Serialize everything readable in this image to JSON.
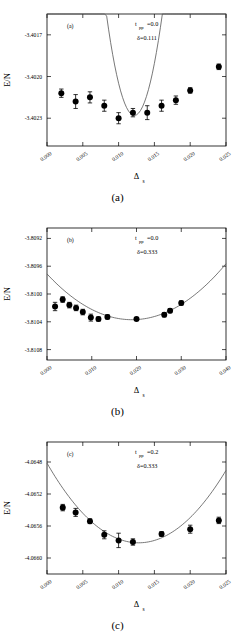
{
  "figure": {
    "panel_captions": [
      "(a)",
      "(b)",
      "(c)"
    ]
  },
  "chart_data": [
    {
      "type": "scatter",
      "panel": "a",
      "panel_tag": "(a)",
      "caption": "(a)",
      "title": "",
      "xlabel": "Δ",
      "xlabel_sub": "s",
      "ylabel": "E/N",
      "xlim": [
        0.0,
        0.025
      ],
      "ylim": [
        -3.4025,
        -3.40155
      ],
      "xticks": [
        0.0,
        0.005,
        0.01,
        0.015,
        0.02,
        0.025
      ],
      "xtick_labels": [
        "0.000",
        "0.005",
        "0.010",
        "0.015",
        "0.020",
        "0.025"
      ],
      "yticks": [
        -3.4017,
        -3.402,
        -3.4023
      ],
      "ytick_labels": [
        "-3.4017",
        "-3.4020",
        "-3.4023"
      ],
      "grid": false,
      "legend": "none",
      "annotations": [
        {
          "text": "t",
          "sub": "pp",
          "tail": "=0.0"
        },
        {
          "text": "δ=0.111",
          "sub": "",
          "tail": ""
        }
      ],
      "annotation_text": [
        "t_pp=0.0",
        "δ=0.111"
      ],
      "x": [
        0.002,
        0.004,
        0.006,
        0.008,
        0.01,
        0.012,
        0.014,
        0.016,
        0.018,
        0.02,
        0.024
      ],
      "y": [
        -3.40212,
        -3.40218,
        -3.40215,
        -3.40221,
        -3.4023,
        -3.40226,
        -3.40226,
        -3.40221,
        -3.40217,
        -3.4021,
        -3.40193
      ],
      "yerr": [
        3e-05,
        5e-05,
        4e-05,
        4e-05,
        4e-05,
        3e-05,
        5e-05,
        4e-05,
        3e-05,
        2e-05,
        2e-05
      ],
      "fit": {
        "type": "parabola",
        "vertex_x": 0.0122,
        "vertex_y": -3.40228,
        "curvature": 1.05
      }
    },
    {
      "type": "scatter",
      "panel": "b",
      "panel_tag": "(b)",
      "caption": "(b)",
      "title": "",
      "xlabel": "Δ",
      "xlabel_sub": "s",
      "ylabel": "E/N",
      "xlim": [
        0.0,
        0.04
      ],
      "ylim": [
        -3.81095,
        -3.80905
      ],
      "xticks": [
        0.0,
        0.01,
        0.02,
        0.03,
        0.04
      ],
      "xtick_labels": [
        "0.000",
        "0.010",
        "0.020",
        "0.030",
        "0.040"
      ],
      "yticks": [
        -3.8092,
        -3.8096,
        -3.81,
        -3.8104,
        -3.8108
      ],
      "ytick_labels": [
        "-3.8092",
        "-3.8096",
        "-3.8100",
        "-3.8104",
        "-3.8108"
      ],
      "grid": false,
      "legend": "none",
      "annotations": [
        {
          "text": "t",
          "sub": "pp",
          "tail": "=0.0"
        },
        {
          "text": "δ=0.333",
          "sub": "",
          "tail": ""
        }
      ],
      "annotation_text": [
        "t_pp=0.0",
        "δ=0.333"
      ],
      "x": [
        0.0018,
        0.0035,
        0.005,
        0.0065,
        0.008,
        0.0098,
        0.0115,
        0.0135,
        0.02,
        0.0262,
        0.0275,
        0.03
      ],
      "y": [
        -3.81018,
        -3.81008,
        -3.81016,
        -3.8102,
        -3.81026,
        -3.81034,
        -3.81036,
        -3.81033,
        -3.81036,
        -3.8103,
        -3.81024,
        -3.81013
      ],
      "yerr": [
        6e-05,
        4e-05,
        4e-05,
        4e-05,
        4e-05,
        5e-05,
        3e-05,
        3e-05,
        2e-05,
        3e-05,
        3e-05,
        3e-05
      ],
      "fit": {
        "type": "parabola",
        "vertex_x": 0.019,
        "vertex_y": -3.81037,
        "curvature": 1.0
      }
    },
    {
      "type": "scatter",
      "panel": "c",
      "panel_tag": "(c)",
      "caption": "(c)",
      "title": "",
      "xlabel": "Δ",
      "xlabel_sub": "s",
      "ylabel": "E/N",
      "xlim": [
        0.0,
        0.025
      ],
      "ylim": [
        -4.0662,
        -4.06455
      ],
      "xticks": [
        0.0,
        0.005,
        0.01,
        0.015,
        0.02,
        0.025
      ],
      "xtick_labels": [
        "0.000",
        "0.005",
        "0.010",
        "0.015",
        "0.020",
        "0.025"
      ],
      "yticks": [
        -4.0648,
        -4.0652,
        -4.0656,
        -4.066
      ],
      "ytick_labels": [
        "-4.0648",
        "-4.0652",
        "-4.0656",
        "-4.0660"
      ],
      "grid": false,
      "legend": "none",
      "annotations": [
        {
          "text": "t",
          "sub": "pp",
          "tail": "=0.2"
        },
        {
          "text": "δ=0.333",
          "sub": "",
          "tail": ""
        }
      ],
      "annotation_text": [
        "t_pp=0.2",
        "δ=0.333"
      ],
      "x": [
        0.0022,
        0.004,
        0.006,
        0.008,
        0.01,
        0.012,
        0.016,
        0.02,
        0.024
      ],
      "y": [
        -4.06537,
        -4.06543,
        -4.06554,
        -4.06571,
        -4.06578,
        -4.0658,
        -4.0657,
        -4.06564,
        -4.06553
      ],
      "yerr": [
        4e-05,
        5e-05,
        3e-05,
        5e-05,
        9e-05,
        4e-05,
        3e-05,
        5e-05,
        4e-05
      ],
      "fit": {
        "type": "parabola",
        "vertex_x": 0.0128,
        "vertex_y": -4.06581,
        "curvature": 1.0
      }
    }
  ]
}
